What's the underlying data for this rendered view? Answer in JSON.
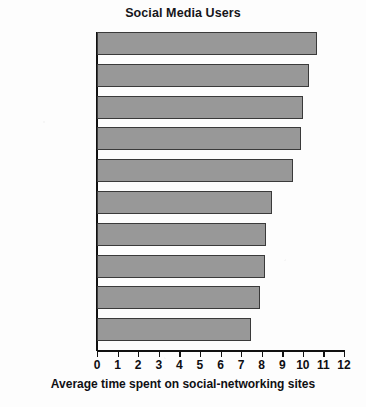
{
  "chart_data": {
    "type": "bar",
    "orientation": "horizontal",
    "title": "Social Media Users",
    "xlabel": "Average time spent on social-networking sites",
    "ylabel": "",
    "categories": [
      "Israel",
      "Argentina",
      "Russia",
      "Turkey",
      "Chile",
      "Philippines",
      "Colombia",
      "Peru",
      "Venezuela",
      "Canada"
    ],
    "values": [
      10.7,
      10.3,
      10.0,
      9.9,
      9.5,
      8.5,
      8.2,
      8.15,
      7.9,
      7.5
    ],
    "xlim": [
      0,
      12
    ],
    "xticks": [
      0,
      1,
      2,
      3,
      4,
      5,
      6,
      7,
      8,
      9,
      10,
      11,
      12
    ],
    "xtick_labels": [
      "0",
      "1",
      "2",
      "3",
      "4",
      "5",
      "6",
      "7",
      "8",
      "9",
      "10",
      "11",
      "12"
    ],
    "grid": false,
    "legend": null,
    "bar_color": "#989898",
    "bar_edge_color": "#3a3a3a",
    "axis_color": "#111111",
    "text_color": "#101014",
    "background": "#fdfdfd"
  }
}
